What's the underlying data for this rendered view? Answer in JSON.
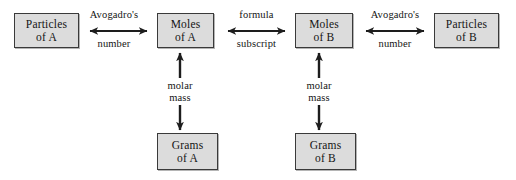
{
  "diagram": {
    "background_color": "#ffffff",
    "node_fill_color": "#dcdcdc",
    "node_border_color": "#3a3a3a",
    "text_color": "#141414",
    "nodes": [
      {
        "id": "particles-a",
        "line1": "Particles",
        "line2": "of A"
      },
      {
        "id": "moles-a",
        "line1": "Moles",
        "line2": "of A"
      },
      {
        "id": "moles-b",
        "line1": "Moles",
        "line2": "of B"
      },
      {
        "id": "particles-b",
        "line1": "Particles",
        "line2": "of B"
      },
      {
        "id": "grams-a",
        "line1": "Grams",
        "line2": "of A"
      },
      {
        "id": "grams-b",
        "line1": "Grams",
        "line2": "of B"
      }
    ],
    "edges": [
      {
        "id": "particles-a-moles-a",
        "direction": "bidirectional",
        "orientation": "horizontal",
        "label_above": "Avogadro's",
        "label_below": "number"
      },
      {
        "id": "moles-a-moles-b",
        "direction": "bidirectional",
        "orientation": "horizontal",
        "label_above": "formula",
        "label_below": "subscript"
      },
      {
        "id": "moles-b-particles-b",
        "direction": "bidirectional",
        "orientation": "horizontal",
        "label_above": "Avogadro's",
        "label_below": "number"
      },
      {
        "id": "moles-a-grams-a",
        "direction": "bidirectional-split",
        "orientation": "vertical",
        "label_above": "molar",
        "label_below": "mass"
      },
      {
        "id": "moles-b-grams-b",
        "direction": "bidirectional-split",
        "orientation": "vertical",
        "label_above": "molar",
        "label_below": "mass"
      }
    ]
  }
}
